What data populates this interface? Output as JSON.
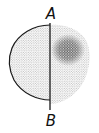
{
  "diagram": {
    "labels": {
      "top": "A",
      "bottom": "B"
    },
    "colors": {
      "stroke": "#1a1a1a",
      "dots_light": "#8a8a8a",
      "dots_dense": "#2a2a2a",
      "background": "#ffffff"
    },
    "regions": [
      {
        "name": "left-half",
        "outline": "solid",
        "fill": "fine-stipple"
      },
      {
        "name": "right-half",
        "outline": "none",
        "fill": "stipple-with-dense-cluster"
      }
    ],
    "divider": {
      "name": "line-AB",
      "orientation": "vertical"
    }
  }
}
